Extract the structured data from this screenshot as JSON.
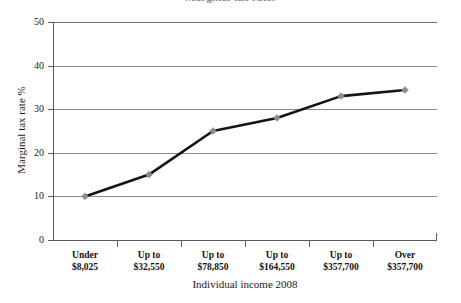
{
  "title_remnant": "Marginal tax rates",
  "chart_data": {
    "type": "line",
    "title": "",
    "xlabel": "Individual income 2008",
    "ylabel": "Marginal tax rate %",
    "categories": [
      "Under\n$8,025",
      "Up to\n$32,550",
      "Up to\n$78,850",
      "Up to\n$164,550",
      "Up to\n$357,700",
      "Over\n$357,700"
    ],
    "category_lines": [
      [
        "Under",
        "$8,025"
      ],
      [
        "Up to",
        "$32,550"
      ],
      [
        "Up to",
        "$78,850"
      ],
      [
        "Up to",
        "$164,550"
      ],
      [
        "Up to",
        "$357,700"
      ],
      [
        "Over",
        "$357,700"
      ]
    ],
    "values": [
      10,
      15,
      25,
      28,
      33,
      34.4
    ],
    "ylim": [
      0,
      50
    ],
    "yticks": [
      0,
      10,
      20,
      30,
      40,
      50
    ],
    "ytick_labels": [
      "0",
      "10",
      "20",
      "30",
      "40",
      "50"
    ],
    "grid": true,
    "grid_axis": "y",
    "legend": false,
    "legend_position": "none",
    "series": [
      {
        "name": "Marginal tax rate %",
        "values": [
          10,
          15,
          25,
          28,
          33,
          34.4
        ],
        "line_color": "#141414",
        "marker_color": "#8c8c8c",
        "marker_shape": "diamond"
      }
    ],
    "colors": {
      "line": "#141414",
      "marker": "#8c8c8c",
      "grid": "#8a8a8a",
      "axis": "#5c5c5c",
      "text": "#1a1a1a",
      "background": "#ffffff"
    }
  }
}
